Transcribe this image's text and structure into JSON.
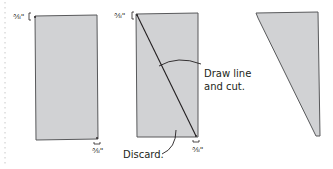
{
  "diagram": {
    "colors": {
      "fill": "#d1d2d4",
      "stroke": "#58595b",
      "text": "#231f20",
      "dotted_guide": "#c8c8c8"
    },
    "panel1": {
      "top_label": "⅜\"",
      "bottom_label": "⅜\""
    },
    "panel2": {
      "top_label": "⅜\"",
      "bottom_label": "⅜\"",
      "callout_draw_line_1": "Draw line",
      "callout_draw_line_2": "and cut.",
      "callout_discard": "Discard."
    },
    "panel3": {}
  }
}
